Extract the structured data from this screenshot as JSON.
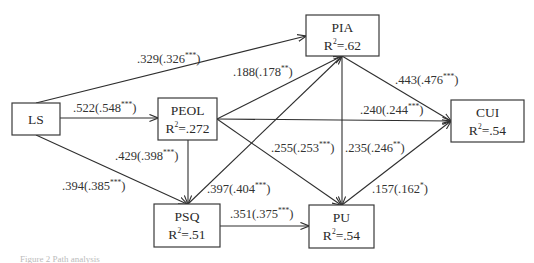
{
  "diagram": {
    "type": "path-model",
    "nodes": [
      {
        "id": "LS",
        "title": "LS",
        "r2": "",
        "x": 12,
        "y": 103,
        "w": 48,
        "h": 32
      },
      {
        "id": "PEOL",
        "title": "PEOL",
        "r2": "=.272",
        "x": 158,
        "y": 98,
        "w": 59,
        "h": 42
      },
      {
        "id": "PIA",
        "title": "PIA",
        "r2": "=.62",
        "x": 306,
        "y": 15,
        "w": 73,
        "h": 41
      },
      {
        "id": "CUI",
        "title": "CUI",
        "r2": "=.54",
        "x": 451,
        "y": 100,
        "w": 73,
        "h": 42
      },
      {
        "id": "PSQ",
        "title": "PSQ",
        "r2": "=.51",
        "x": 154,
        "y": 204,
        "w": 66,
        "h": 43
      },
      {
        "id": "PU",
        "title": "PU",
        "r2": "=.54",
        "x": 309,
        "y": 205,
        "w": 65,
        "h": 43
      }
    ],
    "edges": [
      {
        "from": "LS",
        "to": "PIA",
        "coef": ".329",
        "std": ".326",
        "sig": "***",
        "x1": 36,
        "y1": 103,
        "x2": 306,
        "y2": 36,
        "lx": 137,
        "ly": 63
      },
      {
        "from": "LS",
        "to": "PEOL",
        "coef": ".522",
        "std": ".548",
        "sig": "***",
        "x1": 60,
        "y1": 118,
        "x2": 158,
        "y2": 118,
        "lx": 73,
        "ly": 112
      },
      {
        "from": "LS",
        "to": "PSQ",
        "coef": ".394",
        "std": ".385",
        "sig": "***",
        "x1": 36,
        "y1": 135,
        "x2": 187,
        "y2": 204,
        "lx": 62,
        "ly": 190
      },
      {
        "from": "PEOL",
        "to": "PIA",
        "coef": ".188",
        "std": ".178",
        "sig": "**",
        "x1": 217,
        "y1": 119,
        "x2": 342,
        "y2": 56,
        "lx": 233,
        "ly": 76
      },
      {
        "from": "PEOL",
        "to": "CUI",
        "coef": ".240",
        "std": ".244",
        "sig": "***",
        "x1": 217,
        "y1": 119,
        "x2": 451,
        "y2": 121,
        "lx": 360,
        "ly": 114
      },
      {
        "from": "PEOL",
        "to": "PU",
        "coef": ".255",
        "std": ".253",
        "sig": "***",
        "x1": 217,
        "y1": 119,
        "x2": 341,
        "y2": 205,
        "lx": 271,
        "ly": 152
      },
      {
        "from": "PEOL",
        "to": "PSQ",
        "coef": ".429",
        "std": ".398",
        "sig": "***",
        "x1": 188,
        "y1": 140,
        "x2": 188,
        "y2": 204,
        "lx": 115,
        "ly": 160
      },
      {
        "from": "PSQ",
        "to": "PIA",
        "coef": ".397",
        "std": ".404",
        "sig": "***",
        "x1": 188,
        "y1": 204,
        "x2": 342,
        "y2": 56,
        "lx": 207,
        "ly": 193
      },
      {
        "from": "PIA",
        "to": "CUI",
        "coef": ".443",
        "std": ".476",
        "sig": "***",
        "x1": 342,
        "y1": 56,
        "x2": 451,
        "y2": 121,
        "lx": 395,
        "ly": 84
      },
      {
        "from": "PIA",
        "to": "PU",
        "coef": ".235",
        "std": ".246",
        "sig": "**",
        "x1": 342,
        "y1": 56,
        "x2": 342,
        "y2": 205,
        "lx": 345,
        "ly": 152
      },
      {
        "from": "PU",
        "to": "CUI",
        "coef": ".157",
        "std": ".162",
        "sig": "*",
        "x1": 342,
        "y1": 205,
        "x2": 451,
        "y2": 121,
        "lx": 372,
        "ly": 193
      },
      {
        "from": "PSQ",
        "to": "PU",
        "coef": ".351",
        "std": ".375",
        "sig": "***",
        "x1": 220,
        "y1": 226,
        "x2": 309,
        "y2": 226,
        "lx": 230,
        "ly": 218
      }
    ],
    "r2_prefix": "R",
    "r2_sup": "2",
    "caption": "Figure 2  Path analysis"
  }
}
